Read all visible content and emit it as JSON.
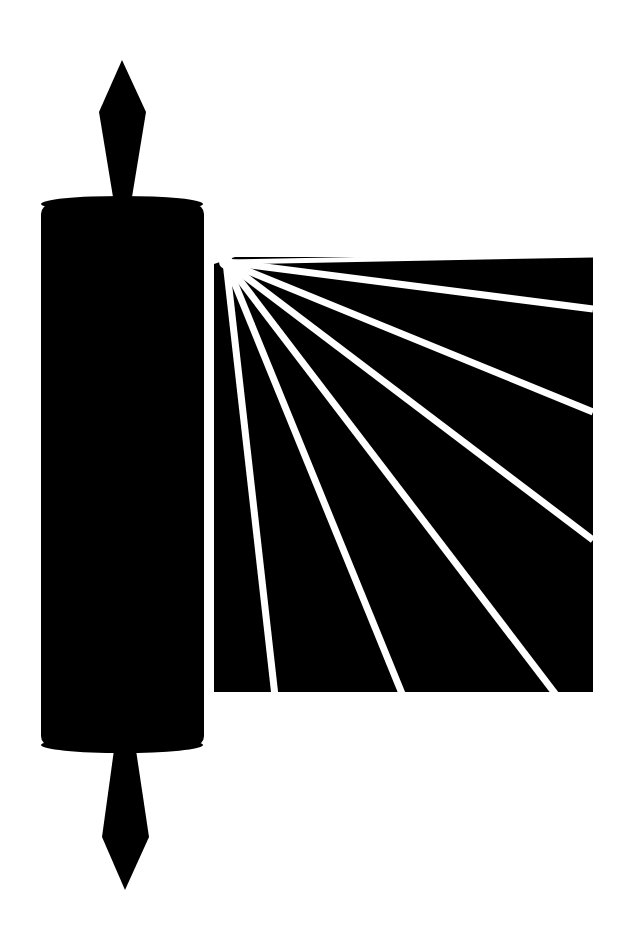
{
  "image": {
    "title": "Torah scroll with radiating light",
    "width": 630,
    "height": 946,
    "background": "#ffffff",
    "foreground": "#000000"
  },
  "scroll": {
    "top_finial": {
      "points": "122,60 146,112 132,197 113,197 99,112"
    },
    "roller": {
      "x": 41,
      "y": 200,
      "width": 163,
      "height": 550,
      "rx": 10
    },
    "roller_top_cap": {
      "cx": 122,
      "cy": 204,
      "rx": 81,
      "ry": 8
    },
    "roller_bottom_cap": {
      "cx": 122,
      "cy": 745,
      "rx": 81,
      "ry": 8
    },
    "bottom_finial": {
      "points": "114,750 136,750 149,837 125,890 102,837"
    }
  },
  "parchment": {
    "polygon": "214,264 235,257 593,257 593,692 214,692",
    "focus": {
      "x": 226,
      "y": 262
    },
    "ray_color": "#ffffff",
    "ray_width": 7,
    "rays": [
      {
        "x": 593,
        "y": 309
      },
      {
        "x": 593,
        "y": 412
      },
      {
        "x": 593,
        "y": 540
      },
      {
        "x": 557,
        "y": 692
      },
      {
        "x": 403,
        "y": 692
      },
      {
        "x": 275,
        "y": 692
      }
    ],
    "top_gap": {
      "x1": 226,
      "y1": 262,
      "x2": 593,
      "y2": 255
    },
    "left_gap": {
      "x1": 217,
      "y1": 262,
      "x2": 219,
      "y2": 692
    }
  }
}
